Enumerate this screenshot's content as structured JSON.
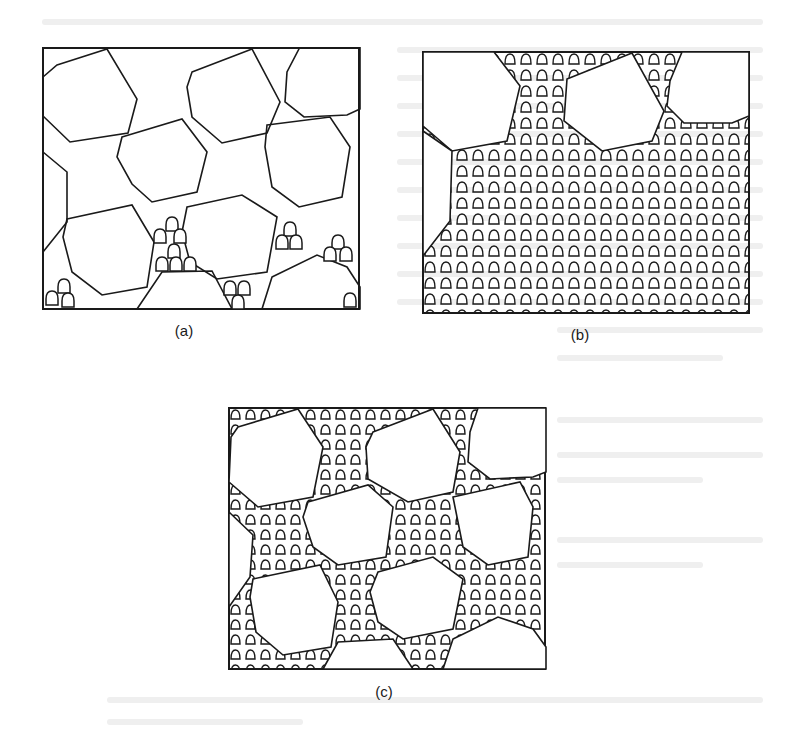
{
  "figure": {
    "panels": [
      {
        "id": "a",
        "label": "(a)"
      },
      {
        "id": "b",
        "label": "(b)"
      },
      {
        "id": "c",
        "label": "(c)"
      }
    ]
  },
  "colors": {
    "ink": "#1a1a1a",
    "ghost_text": "#d6d6d6",
    "background": "#ffffff"
  }
}
